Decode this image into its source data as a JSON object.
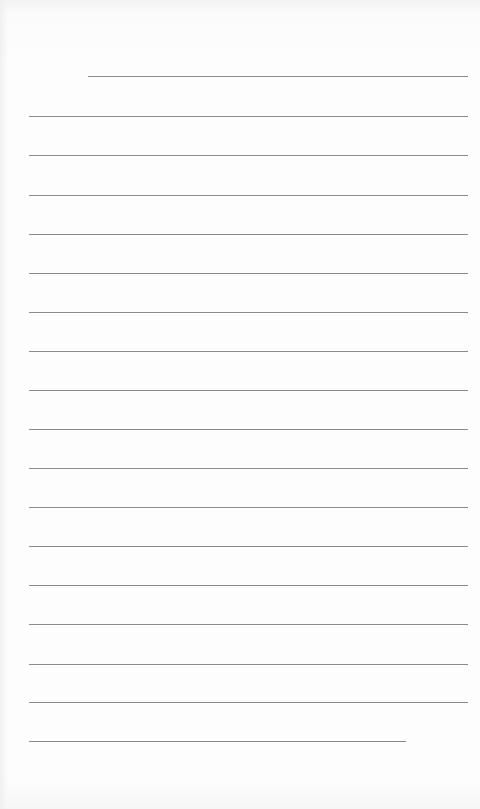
{
  "page": {
    "type": "lined-paper",
    "background_color": "#fdfdfd",
    "line_color": "#8a8a8a"
  },
  "lines": [
    {
      "x1": 88,
      "x2": 468,
      "y": 76
    },
    {
      "x1": 29,
      "x2": 468,
      "y": 116
    },
    {
      "x1": 29,
      "x2": 468,
      "y": 155
    },
    {
      "x1": 29,
      "x2": 468,
      "y": 195
    },
    {
      "x1": 29,
      "x2": 468,
      "y": 234
    },
    {
      "x1": 29,
      "x2": 468,
      "y": 273
    },
    {
      "x1": 29,
      "x2": 468,
      "y": 312
    },
    {
      "x1": 29,
      "x2": 468,
      "y": 351
    },
    {
      "x1": 29,
      "x2": 468,
      "y": 390
    },
    {
      "x1": 29,
      "x2": 468,
      "y": 429
    },
    {
      "x1": 29,
      "x2": 468,
      "y": 468
    },
    {
      "x1": 29,
      "x2": 468,
      "y": 507
    },
    {
      "x1": 29,
      "x2": 468,
      "y": 546
    },
    {
      "x1": 29,
      "x2": 468,
      "y": 585
    },
    {
      "x1": 29,
      "x2": 468,
      "y": 624
    },
    {
      "x1": 29,
      "x2": 468,
      "y": 664
    },
    {
      "x1": 29,
      "x2": 468,
      "y": 702
    },
    {
      "x1": 29,
      "x2": 406,
      "y": 741
    }
  ]
}
